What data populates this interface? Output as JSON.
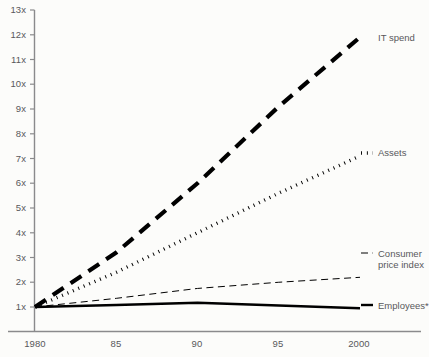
{
  "chart_data": {
    "type": "line",
    "title": "",
    "subtitle": "",
    "xlabel": "",
    "ylabel": "",
    "xlim": [
      1980,
      2000
    ],
    "ylim": [
      0.5,
      13
    ],
    "grid": false,
    "legend_position": "right-of-plot",
    "x": [
      1980,
      1985,
      1990,
      1995,
      2000
    ],
    "xticks": [
      1980,
      1985,
      1990,
      1995,
      2000
    ],
    "xticklabels": [
      "1980",
      "85",
      "90",
      "95",
      "2000"
    ],
    "yticks": [
      1,
      2,
      3,
      4,
      5,
      6,
      7,
      8,
      9,
      10,
      11,
      12,
      13
    ],
    "yticklabels": [
      "1x",
      "2x",
      "3x",
      "4x",
      "5x",
      "6x",
      "7x",
      "8x",
      "9x",
      "10x",
      "11x",
      "12x",
      "13x"
    ],
    "series": [
      {
        "name": "IT spend",
        "style": "long-dash",
        "width": 4.2,
        "color": "#000000",
        "values": [
          1.0,
          3.2,
          6.0,
          9.1,
          11.9
        ]
      },
      {
        "name": "Assets",
        "style": "dotted",
        "width": 3.4,
        "color": "#000000",
        "values": [
          1.0,
          2.4,
          4.0,
          5.6,
          7.1
        ]
      },
      {
        "name": "Consumer price index",
        "style": "thin-dash",
        "width": 1.0,
        "color": "#000000",
        "values": [
          1.0,
          1.35,
          1.75,
          2.0,
          2.2
        ]
      },
      {
        "name": "Employees*",
        "style": "solid",
        "width": 2.4,
        "color": "#000000",
        "values": [
          1.0,
          1.08,
          1.17,
          1.06,
          0.95
        ]
      }
    ]
  },
  "legend": {
    "items": [
      {
        "label": "IT spend",
        "marker": "long-dash"
      },
      {
        "label": "Assets",
        "marker": "dotted"
      },
      {
        "label": "Consumer price index",
        "marker": "thin-dash"
      },
      {
        "label": "Employees*",
        "marker": "solid"
      }
    ],
    "consumer_line1": "Consumer",
    "consumer_line2": "price index"
  },
  "axis": {
    "y_labels": [
      "13x",
      "12x",
      "11x",
      "10x",
      "9x",
      "8x",
      "7x",
      "6x",
      "5x",
      "4x",
      "3x",
      "2x",
      "1x"
    ],
    "x_labels": [
      "1980",
      "85",
      "90",
      "95",
      "2000"
    ],
    "color": "#8a8a8c"
  }
}
